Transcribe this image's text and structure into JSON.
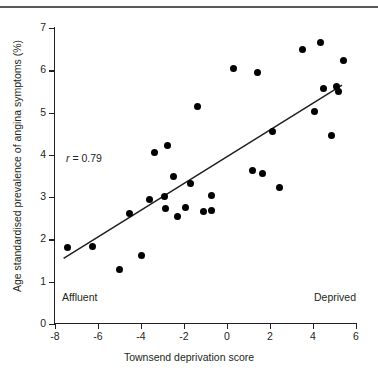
{
  "figure": {
    "top_rule": true,
    "r_label_prefix": "r",
    "r_label_value": " = 0.79",
    "affluent_label": "Affluent",
    "deprived_label": "Deprived"
  },
  "chart_data": {
    "type": "scatter",
    "title": "",
    "xlabel": "Townsend deprivation score",
    "ylabel": "Age standardised prevalence of angina symptoms (%)",
    "xlim": [
      -8,
      6
    ],
    "ylim": [
      0,
      7
    ],
    "xticks": [
      -8,
      -6,
      -4,
      -2,
      0,
      2,
      4,
      6
    ],
    "yticks": [
      0,
      1,
      2,
      3,
      4,
      5,
      6,
      7
    ],
    "xtick_labels": [
      "-8",
      "-6",
      "-4",
      "-2",
      "0",
      "2",
      "4",
      "6"
    ],
    "ytick_labels": [
      "0",
      "1",
      "2",
      "3",
      "4",
      "5",
      "6",
      "7"
    ],
    "grid": false,
    "legend": false,
    "annotations": [
      {
        "text": "r = 0.79",
        "x": -5.5,
        "y": 3.45
      },
      {
        "text": "Affluent",
        "x": -7.6,
        "y": 0.72
      },
      {
        "text": "Deprived",
        "x": 4.1,
        "y": 0.72
      }
    ],
    "correlation_r": 0.79,
    "points": [
      {
        "x": -7.4,
        "y": 1.8
      },
      {
        "x": -6.25,
        "y": 1.83
      },
      {
        "x": -5.0,
        "y": 1.28
      },
      {
        "x": -4.55,
        "y": 2.62
      },
      {
        "x": -4.0,
        "y": 1.62
      },
      {
        "x": -3.6,
        "y": 2.95
      },
      {
        "x": -3.35,
        "y": 4.05
      },
      {
        "x": -2.9,
        "y": 3.02
      },
      {
        "x": -2.85,
        "y": 2.73
      },
      {
        "x": -2.75,
        "y": 4.22
      },
      {
        "x": -2.5,
        "y": 3.5
      },
      {
        "x": -2.3,
        "y": 2.55
      },
      {
        "x": -1.95,
        "y": 2.75
      },
      {
        "x": -1.7,
        "y": 3.32
      },
      {
        "x": -1.35,
        "y": 5.15
      },
      {
        "x": -1.1,
        "y": 2.65
      },
      {
        "x": -0.7,
        "y": 2.68
      },
      {
        "x": -0.7,
        "y": 3.05
      },
      {
        "x": 0.3,
        "y": 6.05
      },
      {
        "x": 1.4,
        "y": 5.95
      },
      {
        "x": 1.2,
        "y": 3.62
      },
      {
        "x": 1.65,
        "y": 3.55
      },
      {
        "x": 2.1,
        "y": 4.55
      },
      {
        "x": 2.45,
        "y": 3.23
      },
      {
        "x": 3.5,
        "y": 6.48
      },
      {
        "x": 4.05,
        "y": 5.03
      },
      {
        "x": 4.35,
        "y": 6.65
      },
      {
        "x": 4.5,
        "y": 5.58
      },
      {
        "x": 4.85,
        "y": 4.45
      },
      {
        "x": 5.1,
        "y": 5.62
      },
      {
        "x": 5.4,
        "y": 6.22
      },
      {
        "x": 5.2,
        "y": 5.5
      }
    ],
    "fit_line": {
      "type": "linear-regression",
      "x_start": -7.6,
      "y_start": 1.55,
      "x_end": 5.35,
      "y_end": 5.65
    }
  }
}
